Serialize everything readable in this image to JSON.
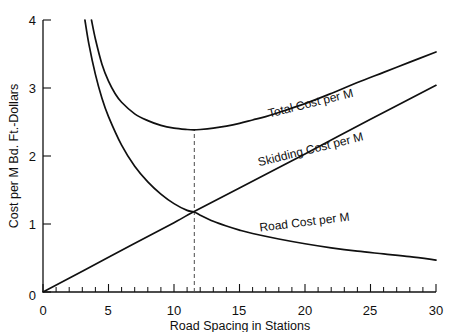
{
  "chart_data": {
    "type": "line",
    "title": "",
    "xlabel": "Road Spacing in Stations",
    "ylabel": "Cost per M Bd. Ft.-Dollars",
    "xlim": [
      0,
      30
    ],
    "ylim": [
      0,
      4
    ],
    "xticks": [
      0,
      5,
      10,
      15,
      20,
      25,
      30
    ],
    "xticklabels": [
      "0",
      "5",
      "10",
      "15",
      "20",
      "25",
      "30"
    ],
    "yticks": [
      0,
      1,
      2,
      3,
      4
    ],
    "yticklabels": [
      "0",
      "1",
      "2",
      "3",
      "4"
    ],
    "minor_tick_step_x": 1,
    "grid": false,
    "legend_position": "inline-labels",
    "series": [
      {
        "name": "Total Cost per M",
        "label": "Total Cost per M",
        "label_x": 20.5,
        "label_y": 2.72,
        "label_rotation": -14,
        "x": [
          3.7,
          4.0,
          4.5,
          5.0,
          5.5,
          6.0,
          7.0,
          8.0,
          9.0,
          10.0,
          11.0,
          11.5,
          12.0,
          13.0,
          14.0,
          15.0,
          16.0,
          17.0,
          18.0,
          20.0,
          22.0,
          24.0,
          26.0,
          28.0,
          30.0
        ],
        "y": [
          4.0,
          3.72,
          3.35,
          3.1,
          2.92,
          2.79,
          2.62,
          2.52,
          2.45,
          2.41,
          2.39,
          2.385,
          2.39,
          2.41,
          2.44,
          2.48,
          2.53,
          2.58,
          2.64,
          2.77,
          2.92,
          3.08,
          3.23,
          3.38,
          3.53
        ]
      },
      {
        "name": "Skidding Cost per M",
        "label": "Skidding Cost per M",
        "label_x": 20.5,
        "label_y": 2.04,
        "label_rotation": -14,
        "x": [
          0,
          5,
          10,
          11.5,
          15,
          20,
          25,
          30
        ],
        "y": [
          0.0,
          0.51,
          1.02,
          1.18,
          1.53,
          2.03,
          2.54,
          3.04
        ]
      },
      {
        "name": "Road Cost per M",
        "label": "Road Cost per M",
        "label_x": 20.0,
        "label_y": 0.97,
        "label_rotation": -7,
        "x": [
          3.2,
          3.5,
          4.0,
          4.5,
          5.0,
          6.0,
          7.0,
          8.0,
          9.0,
          10.0,
          11.0,
          11.5,
          12.0,
          13.0,
          14.0,
          15.0,
          16.0,
          18.0,
          20.0,
          22.0,
          24.0,
          26.0,
          28.0,
          30.0
        ],
        "y": [
          4.0,
          3.65,
          3.2,
          2.85,
          2.58,
          2.16,
          1.85,
          1.62,
          1.44,
          1.3,
          1.2,
          1.18,
          1.13,
          1.04,
          0.97,
          0.91,
          0.86,
          0.78,
          0.71,
          0.65,
          0.6,
          0.56,
          0.52,
          0.47
        ]
      }
    ],
    "annotations": [
      {
        "name": "optimum-spacing-dashed-line",
        "type": "vline",
        "x": 11.55,
        "y_from": 0,
        "y_to": 2.385,
        "style": "dashed"
      },
      {
        "name": "optimum-crossing-point",
        "type": "point",
        "x": 11.55,
        "y": 1.18
      }
    ]
  }
}
